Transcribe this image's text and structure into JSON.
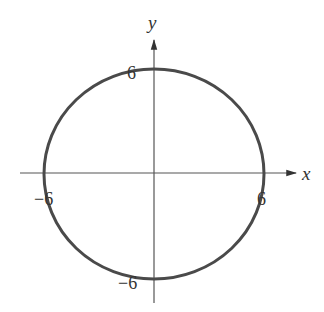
{
  "diagram": {
    "type": "circle-graph",
    "equation_shape": "circle centered at origin, radius 6",
    "axes": {
      "x_label": "x",
      "y_label": "y"
    },
    "tick_labels": {
      "top": "6",
      "bottom": "−6",
      "left": "−6",
      "right": "6"
    },
    "colors": {
      "curve": "#4a4a4a",
      "axes": "#555555",
      "text": "#333333"
    }
  }
}
